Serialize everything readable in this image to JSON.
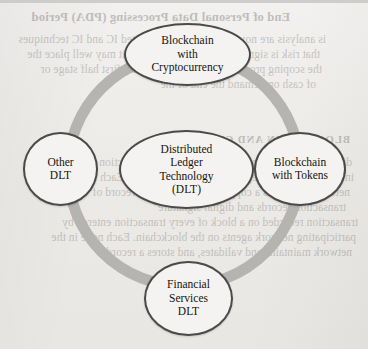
{
  "page": {
    "width": 368,
    "height": 349,
    "background_color": "#efeeec",
    "ink_color": "#15130f"
  },
  "diagram": {
    "type": "concentric-ring-taxonomy",
    "ring": {
      "name": "dlt-relationship-ring",
      "color": "#b6b4b1",
      "center_x": 184,
      "center_y": 170,
      "radius": 116,
      "stroke_width": 11
    },
    "center_node": {
      "id": "distributed-ledger-technology",
      "label": "Distributed\nLedger\nTechnology\n(DLT)",
      "shape": "ellipse",
      "outline_color": "#4a4a4a",
      "fill_color": "#f4f3f1"
    },
    "nodes": [
      {
        "id": "blockchain-with-cryptocurrency",
        "position": "top",
        "label": "Blockchain\nwith\nCryptocurrency",
        "shape": "ellipse",
        "outline_color": "#4a4a4a",
        "fill_color": "#f4f3f1"
      },
      {
        "id": "other-dlt",
        "position": "left",
        "label": "Other\nDLT",
        "shape": "circle",
        "outline_color": "#4a4a4a",
        "fill_color": "#f4f3f1"
      },
      {
        "id": "blockchain-with-tokens",
        "position": "right",
        "label": "Blockchain\nwith Tokens",
        "shape": "circle",
        "outline_color": "#4a4a4a",
        "fill_color": "#f4f3f1"
      },
      {
        "id": "financial-services-dlt",
        "position": "bottom",
        "label": "Financial\nServices\nDLT",
        "shape": "circle",
        "outline_color": "#4a4a4a",
        "fill_color": "#f4f3f1"
      }
    ]
  },
  "bleed_through": {
    "note": "Faint mirrored text showing through from the reverse side of the scanned page",
    "opacity": 0.3,
    "lines": [
      {
        "id": "heading-top",
        "style": "heading",
        "text": "End of Personal Data Processing (PDA) Period"
      },
      {
        "id": "body-top-1",
        "style": "body",
        "text": "is analysis are now based on the aggregated IC and IC techniques"
      },
      {
        "id": "body-top-2",
        "style": "body",
        "text": "that risk is significant and unpredictable; it may well place the"
      },
      {
        "id": "body-top-3",
        "style": "body",
        "text": "the scoping process and the consumer; the first half stage or"
      },
      {
        "id": "body-top-4",
        "style": "body",
        "text": "of cash on demand the end of the"
      },
      {
        "id": "heading-mid",
        "style": "caps",
        "text": "BLOCKCHAIN AND CRYPTO"
      },
      {
        "id": "body-mid-1",
        "style": "body",
        "text": "distributed and decentralised consensus of transaction data"
      },
      {
        "id": "body-mid-2",
        "style": "body",
        "text": "in the transactional segments for the blockchain. Each node in the"
      },
      {
        "id": "body-mid-3",
        "style": "body",
        "text": "network maintains a copy and a timestamp, a record of"
      },
      {
        "id": "body-mid-4",
        "style": "body",
        "text": "transaction records and digital signature"
      },
      {
        "id": "body-bot-1",
        "style": "body",
        "text": "transaction recorded on a block of every transaction entered by"
      },
      {
        "id": "body-bot-2",
        "style": "body",
        "text": "participating network agents on the blockchain. Each node in the"
      },
      {
        "id": "body-bot-3",
        "style": "body",
        "text": "network maintains and validates, and stores a record"
      }
    ]
  }
}
